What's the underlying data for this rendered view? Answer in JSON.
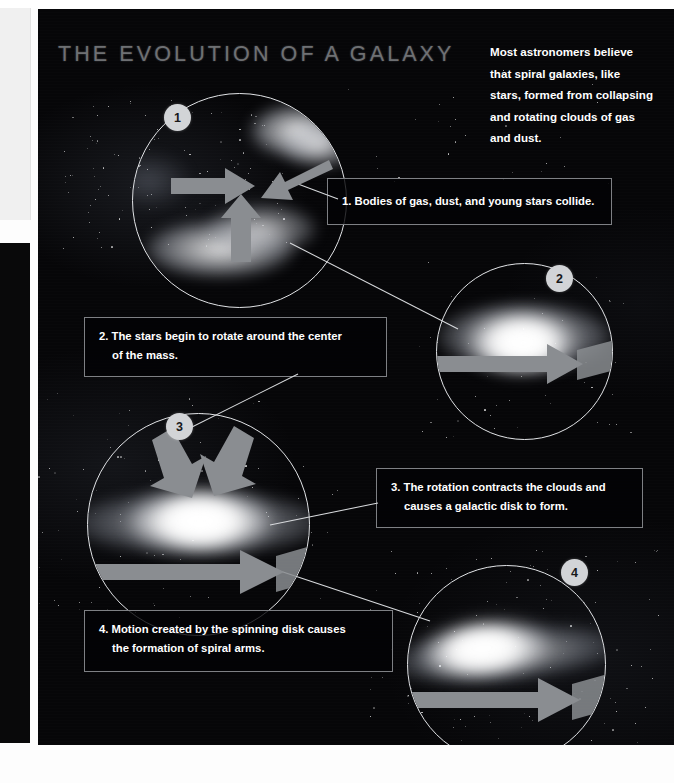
{
  "page": {
    "background_color": "#060608",
    "title": "THE EVOLUTION OF A GALAXY",
    "title_color": "#6e7073"
  },
  "intro": {
    "lines": [
      "Most astronomers believe",
      "that spiral galaxies, like",
      "stars, formed from collapsing",
      "and rotating clouds of gas",
      "and dust."
    ]
  },
  "steps": [
    {
      "number": "1",
      "badge_label": "1",
      "caption_lines": [
        "1. Bodies of gas, dust, and young stars collide."
      ],
      "illustration": "colliding-gas-clouds",
      "arrow_type": "converging-arrows"
    },
    {
      "number": "2",
      "badge_label": "2",
      "caption_lines": [
        "2. The stars begin to rotate around the center",
        "of the mass."
      ],
      "illustration": "merged-glowing-mass",
      "arrow_type": "rotation-ribbon"
    },
    {
      "number": "3",
      "badge_label": "3",
      "caption_lines": [
        "3. The rotation contracts the clouds and",
        "causes a galactic disk to form."
      ],
      "illustration": "flattening-galactic-disk",
      "arrow_type": "contraction-and-rotation"
    },
    {
      "number": "4",
      "badge_label": "4",
      "caption_lines": [
        "4. Motion created by the spinning disk causes",
        "the formation of spiral arms."
      ],
      "illustration": "spiral-galaxy",
      "arrow_type": "rotation-ribbon"
    }
  ],
  "colors": {
    "arrow_gray": "#8a8d91",
    "circle_stroke": "#e2e4e7",
    "badge_fill": "#d2d4d7",
    "caption_border": "#7e8084",
    "text_white": "#ffffff"
  }
}
